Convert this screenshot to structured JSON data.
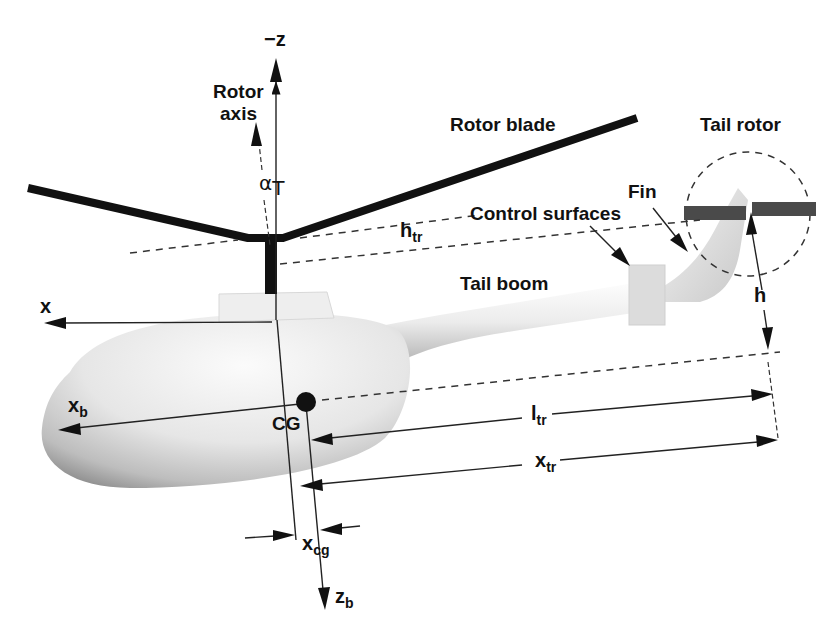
{
  "figure": {
    "labels": {
      "neg_z_axis": "−z",
      "rotor_axis": [
        "Rotor",
        "axis"
      ],
      "rotor_blade": "Rotor blade",
      "tail_rotor": "Tail rotor",
      "fin": "Fin",
      "control_surfaces": "Control surfaces",
      "tail_boom": "Tail boom",
      "x_axis": "x",
      "cg": "CG"
    },
    "symbols": {
      "alpha_t": {
        "base": "α",
        "sub": "T"
      },
      "h_tr": {
        "base": "h",
        "sub": "tr"
      },
      "h": {
        "base": "h",
        "sub": ""
      },
      "x_b": {
        "base": "x",
        "sub": "b"
      },
      "l_tr": {
        "base": "l",
        "sub": "tr"
      },
      "x_tr": {
        "base": "x",
        "sub": "tr"
      },
      "x_cg": {
        "base": "x",
        "sub": "cg"
      },
      "z_b": {
        "base": "z",
        "sub": "b"
      }
    },
    "colors": {
      "ink": "#111111",
      "fuselage_light": "#f4f4f4",
      "fuselage_shadow": "#9a9a9a",
      "tail_rotor_blade": "#4a4a4a",
      "background": "#ffffff"
    }
  }
}
